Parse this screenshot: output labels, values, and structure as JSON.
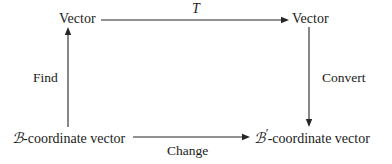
{
  "diagram": {
    "type": "commutative-square",
    "nodes": [
      {
        "id": "top-left",
        "text": "Vector"
      },
      {
        "id": "top-right",
        "text": "Vector"
      },
      {
        "id": "bottom-left",
        "script": "ℬ",
        "suffix": "-coordinate vector",
        "prime": ""
      },
      {
        "id": "bottom-right",
        "script": "ℬ",
        "suffix": "-coordinate vector",
        "prime": "′"
      }
    ],
    "edges": [
      {
        "id": "top",
        "label": "T",
        "from": "top-left",
        "to": "top-right",
        "direction": "right",
        "label_position": "above"
      },
      {
        "id": "left",
        "label": "Find",
        "from": "bottom-left",
        "to": "top-left",
        "direction": "up",
        "label_position": "left"
      },
      {
        "id": "right",
        "label": "Convert",
        "from": "top-right",
        "to": "bottom-right",
        "direction": "down",
        "label_position": "right"
      },
      {
        "id": "bottom",
        "label": "Change",
        "from": "bottom-left",
        "to": "bottom-right",
        "direction": "right",
        "label_position": "below"
      }
    ],
    "colors": {
      "background": "#ffffff",
      "stroke": "#262626",
      "text": "#1b1b1b"
    }
  }
}
